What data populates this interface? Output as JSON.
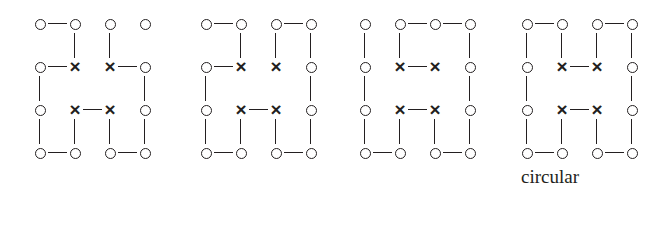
{
  "figure": {
    "title": "",
    "background_color": "#ffffff",
    "ink_color": "#231f20",
    "panel_count": 4,
    "grid_rows": 4,
    "grid_cols": 4,
    "node_glyphs": {
      "o": "o",
      "x": "x"
    },
    "panels": [
      {
        "id": "panel-1",
        "label": "",
        "x": 30,
        "nodes": [
          [
            "o",
            "o",
            "o",
            "o"
          ],
          [
            "o",
            "x",
            "x",
            "o"
          ],
          [
            "o",
            "x",
            "x",
            "o"
          ],
          [
            "o",
            "o",
            "o",
            "o"
          ]
        ],
        "h_bonds": [
          [
            1,
            0,
            0
          ],
          [
            1,
            0,
            1
          ],
          [
            0,
            1,
            0
          ],
          [
            1,
            0,
            1
          ]
        ],
        "v_bonds": [
          [
            0,
            1,
            1,
            0
          ],
          [
            1,
            0,
            0,
            1
          ],
          [
            1,
            1,
            1,
            1
          ]
        ]
      },
      {
        "id": "panel-2",
        "label": "",
        "x": 196,
        "nodes": [
          [
            "o",
            "o",
            "o",
            "o"
          ],
          [
            "o",
            "x",
            "x",
            "o"
          ],
          [
            "o",
            "x",
            "x",
            "o"
          ],
          [
            "o",
            "o",
            "o",
            "o"
          ]
        ],
        "h_bonds": [
          [
            1,
            0,
            1
          ],
          [
            1,
            0,
            0
          ],
          [
            0,
            1,
            0
          ],
          [
            1,
            0,
            1
          ]
        ],
        "v_bonds": [
          [
            0,
            1,
            1,
            1
          ],
          [
            1,
            0,
            0,
            1
          ],
          [
            1,
            1,
            1,
            1
          ]
        ]
      },
      {
        "id": "panel-3",
        "label": "",
        "x": 355,
        "nodes": [
          [
            "o",
            "o",
            "o",
            "o"
          ],
          [
            "o",
            "x",
            "x",
            "o"
          ],
          [
            "o",
            "x",
            "x",
            "o"
          ],
          [
            "o",
            "o",
            "o",
            "o"
          ]
        ],
        "h_bonds": [
          [
            0,
            1,
            1
          ],
          [
            0,
            1,
            0
          ],
          [
            0,
            1,
            0
          ],
          [
            1,
            0,
            1
          ]
        ],
        "v_bonds": [
          [
            1,
            1,
            0,
            1
          ],
          [
            1,
            0,
            0,
            1
          ],
          [
            1,
            1,
            1,
            1
          ]
        ]
      },
      {
        "id": "panel-4",
        "label": "circular",
        "x": 517,
        "nodes": [
          [
            "o",
            "o",
            "o",
            "o"
          ],
          [
            "o",
            "x",
            "x",
            "o"
          ],
          [
            "o",
            "x",
            "x",
            "o"
          ],
          [
            "o",
            "o",
            "o",
            "o"
          ]
        ],
        "h_bonds": [
          [
            1,
            0,
            1
          ],
          [
            0,
            1,
            0
          ],
          [
            0,
            1,
            0
          ],
          [
            1,
            0,
            1
          ]
        ],
        "v_bonds": [
          [
            1,
            1,
            1,
            1
          ],
          [
            1,
            0,
            0,
            1
          ],
          [
            1,
            1,
            1,
            1
          ]
        ]
      }
    ]
  }
}
